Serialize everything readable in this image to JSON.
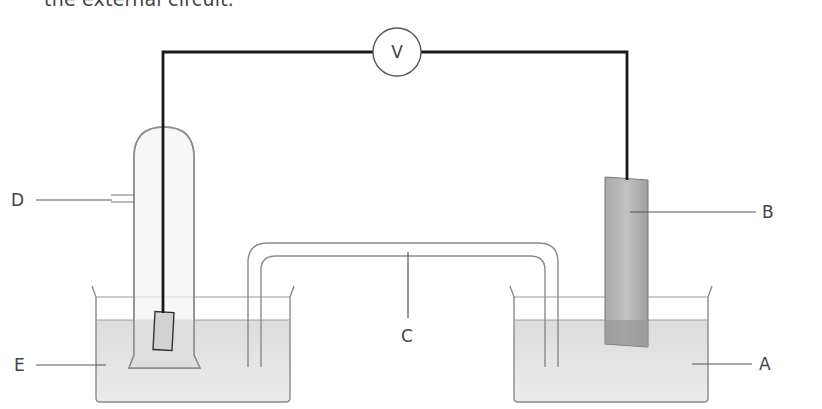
{
  "caption": "the external circuit.",
  "diagram": {
    "type": "electrochemical cell",
    "voltmeter": {
      "label": "V"
    },
    "labels": [
      {
        "id": "A",
        "text": "A",
        "refers_to": "electrolyte solution in right beaker"
      },
      {
        "id": "B",
        "text": "B",
        "refers_to": "metal electrode in right beaker"
      },
      {
        "id": "C",
        "text": "C",
        "refers_to": "salt bridge"
      },
      {
        "id": "D",
        "text": "D",
        "refers_to": "gas inlet of left electrode tube"
      },
      {
        "id": "E",
        "text": "E",
        "refers_to": "electrolyte solution in left beaker"
      }
    ],
    "colors": {
      "wire": "#1a1a1a",
      "glass": "#8a8a8a",
      "liquid": "#e4e4e4",
      "electrode_b": "#b4b4b4",
      "label_text": "#444444"
    }
  }
}
